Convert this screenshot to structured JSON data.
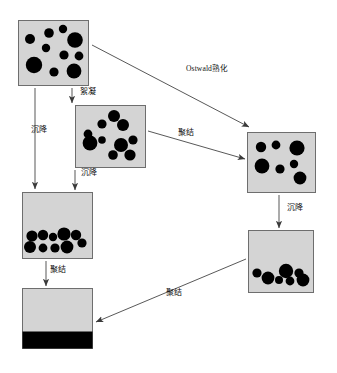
{
  "diagram": {
    "colors": {
      "box_fill": "#d4d4d4",
      "box_border": "#6e6e6e",
      "droplet": "#000000",
      "arrow": "#3a3a3a",
      "background": "#ffffff",
      "text": "#111111"
    },
    "states": [
      {
        "id": "initial-emulsion",
        "name": "initial-emulsion-box",
        "x": 18,
        "y": 20,
        "w": 70,
        "h": 65,
        "droplets": [
          {
            "cx": 12,
            "cy": 19,
            "r": 5.0
          },
          {
            "cx": 31,
            "cy": 13,
            "r": 4.8
          },
          {
            "cx": 45,
            "cy": 9,
            "r": 4.2
          },
          {
            "cx": 28,
            "cy": 28,
            "r": 4.2
          },
          {
            "cx": 57,
            "cy": 20,
            "r": 7.8
          },
          {
            "cx": 46,
            "cy": 35,
            "r": 4.6
          },
          {
            "cx": 16,
            "cy": 45,
            "r": 8.2
          },
          {
            "cx": 61,
            "cy": 36,
            "r": 4.4
          },
          {
            "cx": 36,
            "cy": 52,
            "r": 4.6
          },
          {
            "cx": 56,
            "cy": 51,
            "r": 7.4
          }
        ]
      },
      {
        "id": "flocculated-emulsion",
        "name": "flocculated-emulsion-box",
        "x": 75,
        "y": 105,
        "w": 70,
        "h": 62,
        "droplets": [
          {
            "cx": 39,
            "cy": 11,
            "r": 6.0
          },
          {
            "cx": 27,
            "cy": 19,
            "r": 4.6
          },
          {
            "cx": 48,
            "cy": 20,
            "r": 6.0
          },
          {
            "cx": 13,
            "cy": 29,
            "r": 4.4
          },
          {
            "cx": 15,
            "cy": 38,
            "r": 7.4
          },
          {
            "cx": 27,
            "cy": 35,
            "r": 3.8
          },
          {
            "cx": 46,
            "cy": 40,
            "r": 7.0
          },
          {
            "cx": 58,
            "cy": 35,
            "r": 4.6
          },
          {
            "cx": 38,
            "cy": 50,
            "r": 4.8
          },
          {
            "cx": 55,
            "cy": 50,
            "r": 5.6
          }
        ]
      },
      {
        "id": "ripened-emulsion",
        "name": "ostwald-ripened-emulsion-box",
        "x": 247,
        "y": 132,
        "w": 68,
        "h": 60,
        "droplets": [
          {
            "cx": 14,
            "cy": 15,
            "r": 5.2
          },
          {
            "cx": 29,
            "cy": 13,
            "r": 4.4
          },
          {
            "cx": 50,
            "cy": 16,
            "r": 7.6
          },
          {
            "cx": 15,
            "cy": 34,
            "r": 7.4
          },
          {
            "cx": 33,
            "cy": 37,
            "r": 4.6
          },
          {
            "cx": 47,
            "cy": 32,
            "r": 4.2
          },
          {
            "cx": 53,
            "cy": 46,
            "r": 6.4
          }
        ]
      },
      {
        "id": "creamed-sediment",
        "name": "sedimented-emulsion-box",
        "x": 22,
        "y": 192,
        "w": 70,
        "h": 66,
        "droplets": [
          {
            "cx": 10,
            "cy": 44,
            "r": 5.6
          },
          {
            "cx": 21,
            "cy": 43,
            "r": 5.2
          },
          {
            "cx": 31,
            "cy": 45,
            "r": 4.2
          },
          {
            "cx": 42,
            "cy": 42,
            "r": 6.6
          },
          {
            "cx": 54,
            "cy": 43,
            "r": 5.2
          },
          {
            "cx": 8,
            "cy": 55,
            "r": 6.0
          },
          {
            "cx": 21,
            "cy": 56,
            "r": 4.4
          },
          {
            "cx": 33,
            "cy": 56,
            "r": 4.6
          },
          {
            "cx": 45,
            "cy": 55,
            "r": 6.4
          },
          {
            "cx": 60,
            "cy": 51,
            "r": 4.6
          }
        ]
      },
      {
        "id": "ripened-sediment",
        "name": "ripened-sedimented-emulsion-box",
        "x": 248,
        "y": 230,
        "w": 65,
        "h": 62,
        "droplets": [
          {
            "cx": 9,
            "cy": 43,
            "r": 4.6
          },
          {
            "cx": 20,
            "cy": 48,
            "r": 6.4
          },
          {
            "cx": 31,
            "cy": 50,
            "r": 4.0
          },
          {
            "cx": 38,
            "cy": 41,
            "r": 7.2
          },
          {
            "cx": 42,
            "cy": 51,
            "r": 4.4
          },
          {
            "cx": 51,
            "cy": 43,
            "r": 4.6
          },
          {
            "cx": 55,
            "cy": 50,
            "r": 6.4
          }
        ]
      },
      {
        "id": "coalesced-phases",
        "name": "coalesced-phase-separation-box",
        "x": 22,
        "y": 288,
        "w": 70,
        "h": 60,
        "oil_band": {
          "height": 17
        }
      }
    ],
    "arrows": [
      {
        "id": "arrow-ostwald",
        "name": "arrow-ostwald-ripening",
        "from": "initial-emulsion",
        "to": "ripened-emulsion",
        "label": "Ostwald熟化",
        "label_x": 186,
        "label_y": 64,
        "x1": 92,
        "y1": 45,
        "x2": 249,
        "y2": 127
      },
      {
        "id": "arrow-floc",
        "name": "arrow-flocculation",
        "from": "initial-emulsion",
        "to": "flocculated-emulsion",
        "label": "絮凝",
        "label_x": 80,
        "label_y": 87,
        "x1": 72,
        "y1": 88,
        "x2": 72,
        "y2": 103
      },
      {
        "id": "arrow-sediment-left",
        "name": "arrow-sedimentation-left",
        "from": "initial-emulsion",
        "to": "creamed-sediment",
        "label": "沉降",
        "label_x": 31,
        "label_y": 125,
        "x1": 35,
        "y1": 88,
        "x2": 35,
        "y2": 189
      },
      {
        "id": "arrow-floc-coalesce",
        "name": "arrow-coalescence-to-ripened",
        "from": "flocculated-emulsion",
        "to": "ripened-emulsion",
        "label": "聚结",
        "label_x": 178,
        "label_y": 128,
        "x1": 148,
        "y1": 131,
        "x2": 245,
        "y2": 159
      },
      {
        "id": "arrow-sediment-mid",
        "name": "arrow-sedimentation-middle",
        "from": "flocculated-emulsion",
        "to": "creamed-sediment",
        "label": "沉降",
        "label_x": 81,
        "label_y": 168,
        "x1": 75,
        "y1": 170,
        "x2": 75,
        "y2": 190
      },
      {
        "id": "arrow-sediment-right",
        "name": "arrow-sedimentation-right",
        "from": "ripened-emulsion",
        "to": "ripened-sediment",
        "label": "沉降",
        "label_x": 287,
        "label_y": 203,
        "x1": 279,
        "y1": 195,
        "x2": 279,
        "y2": 228
      },
      {
        "id": "arrow-coalesce-left",
        "name": "arrow-coalescence-left",
        "from": "creamed-sediment",
        "to": "coalesced-phases",
        "label": "聚结",
        "label_x": 50,
        "label_y": 265,
        "x1": 46,
        "y1": 261,
        "x2": 46,
        "y2": 286
      },
      {
        "id": "arrow-coalesce-diag",
        "name": "arrow-coalescence-diagonal",
        "from": "ripened-sediment",
        "to": "coalesced-phases",
        "label": "聚结",
        "label_x": 166,
        "label_y": 288,
        "x1": 246,
        "y1": 259,
        "x2": 96,
        "y2": 322
      }
    ],
    "legend_terms": {
      "ostwald": "Ostwald熟化",
      "flocculation": "絮凝",
      "sedimentation": "沉降",
      "coalescence": "聚结"
    }
  }
}
